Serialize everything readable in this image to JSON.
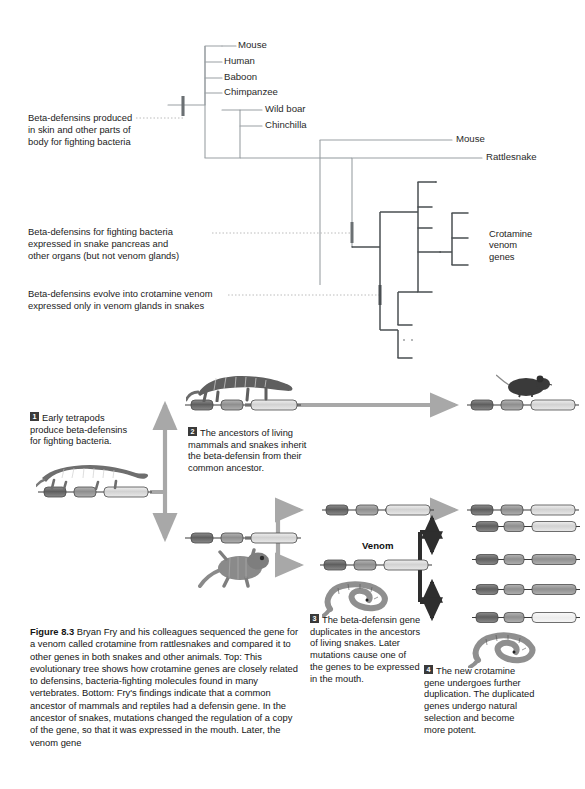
{
  "figure": {
    "number": "Figure 8.3",
    "caption": "Bryan Fry and his colleagues sequenced the gene for a venom called crotamine from rattlesnakes and compared it to other genes in both snakes and other animals. Top: This evolutionary tree shows how crotamine genes are closely related to defensins, bacteria-fighting molecules found in many vertebrates. Bottom: Fry's findings indicate that a common ancestor of mammals and reptiles had a defensin gene. In the ancestor of snakes, mutations changed the regulation of a copy of the gene, so that it was expressed in the mouth. Later, the venom gene"
  },
  "tree": {
    "tips": [
      {
        "label": "Mouse"
      },
      {
        "label": "Human"
      },
      {
        "label": "Baboon"
      },
      {
        "label": "Chimpanzee"
      },
      {
        "label": "Wild boar"
      },
      {
        "label": "Chinchilla"
      },
      {
        "label": "Mouse"
      },
      {
        "label": "Rattlesnake"
      }
    ],
    "group_label": "Crotamine\nvenom\ngenes",
    "annotations": [
      {
        "id": "anno-beta-defensins-skin",
        "text": "Beta-defensins produced\nin skin and other parts of\nbody for fighting bacteria"
      },
      {
        "id": "anno-beta-defensins-pancreas",
        "text": "Beta-defensins for fighting bacteria\nexpressed in snake pancreas and\nother organs (but not venom glands)"
      },
      {
        "id": "anno-crotamine-venom",
        "text": "Beta-defensins evolve into crotamine venom\nexpressed only in venom glands in snakes"
      }
    ]
  },
  "steps": [
    {
      "num": "1",
      "text": "Early tetrapods\nproduce beta-defensins\nfor fighting bacteria."
    },
    {
      "num": "2",
      "text": "The ancestors of living\nmammals and snakes inherit\nthe beta-defensin from their\ncommon ancestor."
    },
    {
      "num": "3",
      "text": "The beta-defensin gene\nduplicates in the ancestors\nof living snakes. Later\nmutations cause one of\nthe genes to be expressed\nin the mouth."
    },
    {
      "num": "4",
      "text": "The new crotamine\ngene undergoes further\nduplication. The duplicated\ngenes undergo natural\nselection and become\nmore potent."
    }
  ],
  "labels": {
    "venom": "Venom"
  },
  "icons": {
    "early_tetrapod": "tetrapod-icon",
    "mammal_ancestor": "cynodont-icon",
    "mouse": "mouse-icon",
    "lizard": "lizard-icon",
    "snake": "snake-icon"
  },
  "colors": {
    "tree_line_light": "#9aa0a4",
    "tree_line_dark": "#4a4f52",
    "arrow_gray": "#a8a8a8",
    "arrow_dark": "#2e2e2e",
    "gene_dark": "#6f6f6f",
    "gene_light": "#d9d9d9",
    "text": "#1a1a1a"
  }
}
